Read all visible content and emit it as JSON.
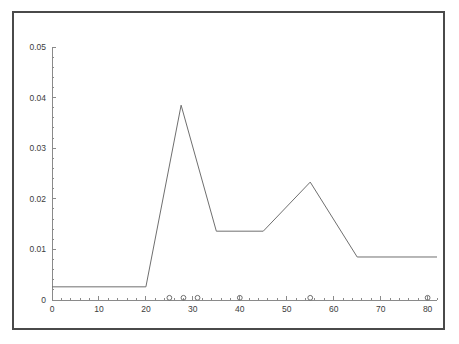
{
  "chart_data": {
    "type": "line",
    "title": "",
    "subtitle": "",
    "xlabel": "",
    "ylabel": "",
    "xlim": [
      0,
      82
    ],
    "ylim": [
      0,
      0.05
    ],
    "grid": false,
    "legend": null,
    "x_ticks": [
      0,
      10,
      20,
      30,
      40,
      50,
      60,
      70,
      80
    ],
    "x_tick_labels": [
      "0",
      "10",
      "20",
      "30",
      "40",
      "50",
      "60",
      "70",
      "80"
    ],
    "x_minor_tick_step": 2,
    "y_ticks": [
      0,
      0.01,
      0.02,
      0.03,
      0.04,
      0.05
    ],
    "y_tick_labels": [
      "0",
      "0.01",
      "0.02",
      "0.03",
      "0.04",
      "0.05"
    ],
    "y_minor_tick_step": 0.002,
    "series": [
      {
        "name": "series-1",
        "color": "#6f6f6f",
        "x": [
          0,
          20,
          27.5,
          35,
          45,
          55,
          65,
          82
        ],
        "y": [
          0.0026,
          0.0026,
          0.0385,
          0.0136,
          0.0136,
          0.0233,
          0.0085,
          0.0085
        ]
      }
    ],
    "axis_markers": {
      "name": "baseline-circle-markers",
      "y": 0,
      "x": [
        25,
        28,
        31,
        40,
        55,
        80
      ],
      "color": "#6f6f6f"
    }
  },
  "figure": {
    "frame_color": "#4a4a4a",
    "background_color": "#ffffff",
    "axis_color": "#8a8a8a",
    "line_color": "#6f6f6f"
  }
}
